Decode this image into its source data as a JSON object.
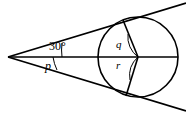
{
  "figure": {
    "type": "geometry-diagram",
    "background_color": "#ffffff",
    "stroke_color": "#000000",
    "labels": {
      "apex_angle": "30°",
      "angle_p": "p",
      "angle_q": "q",
      "angle_r": "r"
    },
    "geometry": {
      "apex": {
        "x": 8,
        "y": 57
      },
      "circle": {
        "cx": 138,
        "cy": 57,
        "r": 40
      },
      "tangent_point_upper": {
        "x": 123,
        "y": 22
      },
      "tangent_point_lower": {
        "x": 126,
        "y": 96
      },
      "upper_tangent_end": {
        "x": 186,
        "y": 3
      },
      "lower_tangent_end": {
        "x": 186,
        "y": 111
      },
      "axis_start": {
        "x": 8,
        "y": 57
      },
      "axis_end": {
        "x": 178,
        "y": 57
      }
    },
    "arcs": {
      "apex_arc_upper_label": "30°",
      "apex_arc_lower_label": "p",
      "centre_arc_upper_label": "q",
      "centre_arc_lower_label": "r"
    }
  }
}
